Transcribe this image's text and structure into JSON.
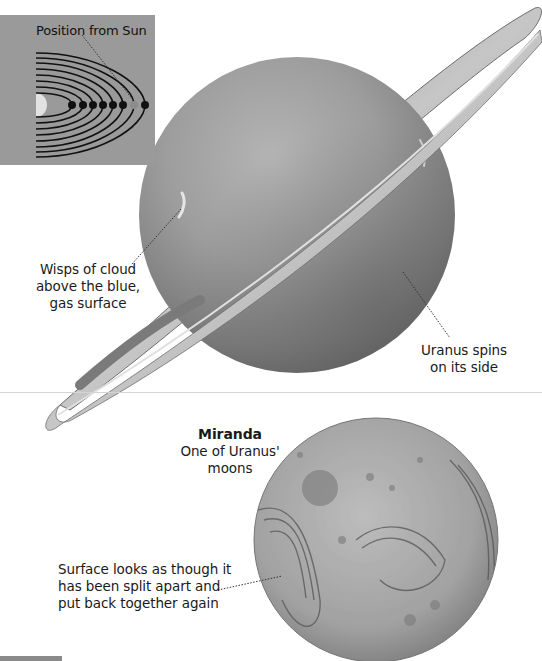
{
  "inset": {
    "title": "Position from Sun",
    "orbit_count": 8,
    "highlighted_planet_index": 6,
    "colors": {
      "background": "#9a9a9a",
      "orbit": "#111111",
      "sun": "#e2e2e2",
      "highlight": "#8c8c8c"
    }
  },
  "uranus": {
    "labels": {
      "clouds": [
        "Wisps of cloud",
        "above the blue,",
        "gas surface"
      ],
      "spins": [
        "Uranus spins",
        "on its side"
      ]
    }
  },
  "miranda": {
    "title": "Miranda",
    "subtitle": [
      "One of Uranus'",
      "moons"
    ],
    "surface_label": [
      "Surface looks as though it",
      "has been split apart and",
      "put back together again"
    ]
  }
}
